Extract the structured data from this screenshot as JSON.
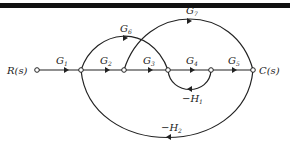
{
  "diagram": {
    "type": "signal-flow-graph",
    "input": {
      "label": "R(s)"
    },
    "output": {
      "label": "C(s)"
    },
    "nodes": [
      {
        "id": "n1",
        "label": "R(s)",
        "x": 37,
        "y": 70
      },
      {
        "id": "n2",
        "label": "",
        "x": 81,
        "y": 70
      },
      {
        "id": "n3",
        "label": "",
        "x": 124,
        "y": 70
      },
      {
        "id": "n4",
        "label": "",
        "x": 168,
        "y": 70
      },
      {
        "id": "n5",
        "label": "",
        "x": 211,
        "y": 70
      },
      {
        "id": "n6",
        "label": "C(s)",
        "x": 253,
        "y": 70
      }
    ],
    "branches": [
      {
        "from": "n1",
        "to": "n2",
        "gain": "G",
        "sub": "1"
      },
      {
        "from": "n2",
        "to": "n3",
        "gain": "G",
        "sub": "2"
      },
      {
        "from": "n3",
        "to": "n4",
        "gain": "G",
        "sub": "3"
      },
      {
        "from": "n4",
        "to": "n5",
        "gain": "G",
        "sub": "4"
      },
      {
        "from": "n5",
        "to": "n6",
        "gain": "G",
        "sub": "5"
      },
      {
        "from": "n2",
        "to": "n4",
        "gain": "G",
        "sub": "6"
      },
      {
        "from": "n3",
        "to": "n6",
        "gain": "G",
        "sub": "7"
      },
      {
        "from": "n5",
        "to": "n4",
        "gain": "-H",
        "sub": "1"
      },
      {
        "from": "n6",
        "to": "n2",
        "gain": "-H",
        "sub": "2"
      }
    ]
  },
  "labels": {
    "R": "R(s)",
    "C": "C(s)",
    "G1": "G",
    "G1s": "1",
    "G2": "G",
    "G2s": "2",
    "G3": "G",
    "G3s": "3",
    "G4": "G",
    "G4s": "4",
    "G5": "G",
    "G5s": "5",
    "G6": "G",
    "G6s": "6",
    "G7": "G",
    "G7s": "7",
    "H1": "−H",
    "H1s": "1",
    "H2": "−H",
    "H2s": "2"
  }
}
